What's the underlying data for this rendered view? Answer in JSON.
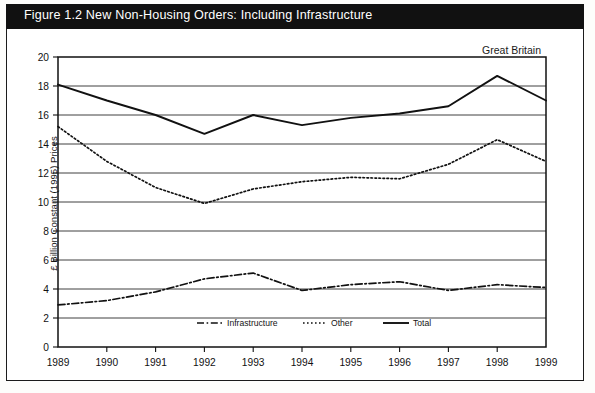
{
  "figure": {
    "title": "Figure 1.2  New Non-Housing Orders: Including Infrastructure",
    "region_note": "Great Britain"
  },
  "chart_data": {
    "type": "line",
    "title": "Figure 1.2  New Non-Housing Orders: Including Infrastructure",
    "annotation": "Great Britain",
    "xlabel": "",
    "ylabel": "£ Billion Constant (1995) Prices",
    "categories": [
      "1989",
      "1990",
      "1991",
      "1992",
      "1993",
      "1994",
      "1995",
      "1996",
      "1997",
      "1998",
      "1999"
    ],
    "xtick_labels": [
      "1989",
      "1990",
      "1991",
      "1992",
      "1993",
      "1994",
      "1995",
      "1996",
      "1997",
      "1998",
      "1999"
    ],
    "ytick_labels": [
      "0",
      "2",
      "4",
      "6",
      "8",
      "10",
      "12",
      "14",
      "16",
      "18",
      "20"
    ],
    "ylim": [
      0,
      20
    ],
    "ytick_step": 2,
    "grid": true,
    "grid_axis": "y",
    "legend_position": "bottom-center-inside",
    "series": [
      {
        "name": "Infrastructure",
        "style": "dashdot",
        "color": "#111111",
        "values": [
          2.9,
          3.2,
          3.8,
          4.7,
          5.1,
          3.9,
          4.3,
          4.5,
          3.9,
          4.3,
          4.1
        ]
      },
      {
        "name": "Other",
        "style": "dotted",
        "color": "#111111",
        "values": [
          15.2,
          12.8,
          11.0,
          9.9,
          10.9,
          11.4,
          11.7,
          11.6,
          12.6,
          14.3,
          12.8
        ]
      },
      {
        "name": "Total",
        "style": "solid",
        "color": "#111111",
        "values": [
          18.1,
          17.0,
          16.0,
          14.7,
          16.0,
          15.3,
          15.8,
          16.1,
          16.6,
          18.7,
          17.0
        ]
      }
    ]
  },
  "legend": {
    "items": [
      {
        "label": "Infrastructure"
      },
      {
        "label": "Other"
      },
      {
        "label": "Total"
      }
    ]
  }
}
